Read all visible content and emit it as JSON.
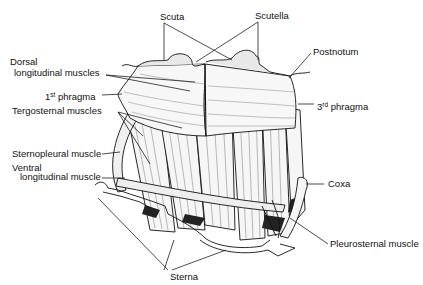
{
  "diagram": {
    "type": "anatomical illustration",
    "colors": {
      "ink": "#111111",
      "background": "#ffffff",
      "muscle_fill": "#f4f4f4",
      "shade": "#bdbdbd"
    }
  },
  "labels": {
    "scuta": "Scuta",
    "scutella": "Scutella",
    "postnotum": "Postnotum",
    "dorsal_line1": "Dorsal",
    "dorsal_line2": "longitudinal muscles",
    "phragma1_num": "1",
    "phragma1_sup": "st",
    "phragma1_text": " phragma",
    "phragma3_num": "3",
    "phragma3_sup": "rd",
    "phragma3_text": " phragma",
    "tergosternal": "Tergosternal muscles",
    "sternopleural": "Sternopleural muscle",
    "ventral_line1": "Ventral",
    "ventral_line2": "longitudinal muscle",
    "coxa": "Coxa",
    "pleurosternal": "Pleurosternal muscle",
    "sterna": "Sterna"
  }
}
